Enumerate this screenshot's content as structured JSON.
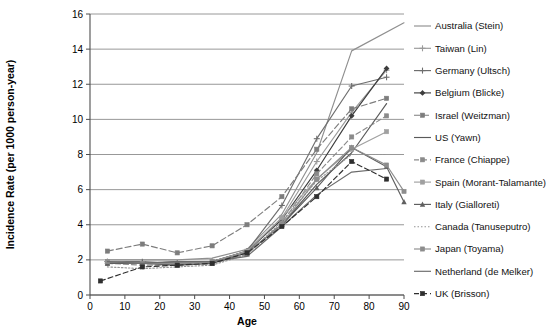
{
  "chart_data": {
    "type": "line",
    "title": "",
    "xlabel": "Age",
    "ylabel": "Incidence Rate (per 1000 person-year)",
    "xlim": [
      0,
      90
    ],
    "ylim": [
      0,
      16
    ],
    "xticks": [
      0,
      10,
      20,
      30,
      40,
      50,
      60,
      70,
      80,
      90
    ],
    "yticks": [
      0,
      2,
      4,
      6,
      8,
      10,
      12,
      14,
      16
    ],
    "grid": "horizontal",
    "legend_position": "right",
    "series": [
      {
        "name": "Australia (Stein)",
        "color": "#8f8f8f",
        "dash": "none",
        "marker": "none",
        "x": [
          5,
          15,
          25,
          35,
          45,
          55,
          65,
          75,
          90
        ],
        "y": [
          2.0,
          2.0,
          2.0,
          2.1,
          2.6,
          4.6,
          8.1,
          13.9,
          15.5
        ]
      },
      {
        "name": "Taiwan (Lin)",
        "color": "#9a9a9a",
        "dash": "none",
        "marker": "plus",
        "x": [
          5,
          15,
          25,
          35,
          45,
          55,
          65,
          75,
          85
        ],
        "y": [
          1.9,
          1.8,
          1.8,
          1.9,
          2.4,
          4.4,
          7.6,
          10.4,
          12.8
        ]
      },
      {
        "name": "Germany (Ultsch)",
        "color": "#6e6e6e",
        "dash": "none",
        "marker": "plus",
        "x": [
          5,
          15,
          25,
          35,
          45,
          55,
          65,
          75,
          85
        ],
        "y": [
          1.9,
          1.9,
          1.8,
          1.9,
          2.5,
          5.1,
          8.9,
          11.9,
          12.4
        ]
      },
      {
        "name": "Belgium (Blicke)",
        "color": "#3d3d3d",
        "dash": "none",
        "marker": "diamond",
        "x": [
          5,
          15,
          25,
          35,
          45,
          55,
          65,
          75,
          85
        ],
        "y": [
          1.8,
          1.8,
          1.8,
          1.9,
          2.5,
          4.3,
          7.1,
          10.2,
          12.9
        ]
      },
      {
        "name": "Israel (Weitzman)",
        "color": "#7d7d7d",
        "dash": "6,3",
        "marker": "square",
        "x": [
          5,
          15,
          25,
          35,
          45,
          55,
          65,
          75,
          85
        ],
        "y": [
          2.5,
          2.9,
          2.4,
          2.8,
          4.0,
          5.6,
          8.3,
          10.6,
          11.2
        ]
      },
      {
        "name": "US (Yawn)",
        "color": "#5a5a5a",
        "dash": "none",
        "marker": "none",
        "x": [
          5,
          15,
          25,
          35,
          45,
          55,
          65,
          75,
          85
        ],
        "y": [
          1.9,
          1.8,
          1.9,
          1.9,
          2.4,
          4.0,
          6.3,
          8.1,
          10.9
        ]
      },
      {
        "name": "France (Chiappe)",
        "color": "#8a8a8a",
        "dash": "5,3",
        "marker": "square",
        "x": [
          5,
          15,
          25,
          35,
          45,
          55,
          65,
          75,
          85
        ],
        "y": [
          1.8,
          1.7,
          1.7,
          1.8,
          2.3,
          4.1,
          6.9,
          9.0,
          10.2
        ]
      },
      {
        "name": "Spain (Morant-Talamante)",
        "color": "#a0a0a0",
        "dash": "none",
        "marker": "square",
        "x": [
          5,
          15,
          25,
          35,
          45,
          55,
          65,
          75,
          85
        ],
        "y": [
          1.9,
          1.8,
          1.8,
          1.9,
          2.5,
          4.4,
          6.6,
          8.3,
          9.3
        ]
      },
      {
        "name": "Italy (Gialloreti)",
        "color": "#5f5f5f",
        "dash": "none",
        "marker": "triangle",
        "x": [
          5,
          15,
          25,
          35,
          45,
          55,
          65,
          75,
          85,
          90
        ],
        "y": [
          1.8,
          1.8,
          1.7,
          1.8,
          2.4,
          4.0,
          6.1,
          8.4,
          7.3,
          5.3
        ]
      },
      {
        "name": "Canada (Tanuseputro)",
        "color": "#949494",
        "dash": "1.5,2",
        "marker": "none",
        "x": [
          5,
          15,
          25,
          35,
          45,
          55,
          65,
          75,
          85
        ],
        "y": [
          1.6,
          1.5,
          1.6,
          1.7,
          2.3,
          4.2,
          6.5,
          8.0,
          8.0
        ]
      },
      {
        "name": "Japan (Toyama)",
        "color": "#8d8d8d",
        "dash": "none",
        "marker": "square",
        "x": [
          5,
          15,
          25,
          35,
          45,
          55,
          65,
          75,
          85,
          90
        ],
        "y": [
          1.9,
          1.8,
          1.8,
          1.9,
          2.4,
          4.0,
          6.6,
          8.4,
          7.4,
          5.9
        ]
      },
      {
        "name": "Netherland (de Melker)",
        "color": "#6b6b6b",
        "dash": "none",
        "marker": "none",
        "x": [
          5,
          15,
          25,
          35,
          45,
          55,
          65,
          75,
          85
        ],
        "y": [
          1.9,
          1.8,
          1.9,
          1.9,
          2.2,
          3.9,
          5.7,
          7.0,
          7.2
        ]
      },
      {
        "name": "UK (Brisson)",
        "color": "#2f2f2f",
        "dash": "5,3",
        "marker": "square",
        "x": [
          3,
          15,
          25,
          35,
          45,
          55,
          65,
          75,
          85
        ],
        "y": [
          0.8,
          1.6,
          1.7,
          1.8,
          2.4,
          3.9,
          5.6,
          7.6,
          6.6
        ]
      }
    ]
  }
}
